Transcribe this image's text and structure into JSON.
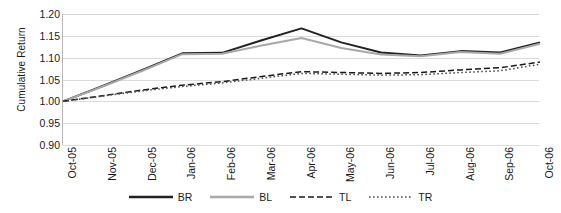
{
  "chart_data": {
    "type": "line",
    "title": "",
    "xlabel": "",
    "ylabel": "Cumulative Return",
    "ylim": [
      0.9,
      1.2
    ],
    "ytick_step": 0.05,
    "yticks": [
      "0.90",
      "0.95",
      "1.00",
      "1.05",
      "1.10",
      "1.15",
      "1.20"
    ],
    "grid": true,
    "legend_position": "bottom",
    "categories": [
      "Oct-05",
      "Nov-05",
      "Dec-05",
      "Jan-06",
      "Feb-06",
      "Mar-06",
      "Apr-06",
      "May-06",
      "Jun-06",
      "Jul-06",
      "Aug-06",
      "Sep-06",
      "Oct-06"
    ],
    "series": [
      {
        "name": "BR",
        "style": "solid",
        "color": "#222222",
        "values": [
          1.0,
          1.035,
          1.072,
          1.11,
          1.111,
          1.14,
          1.167,
          1.135,
          1.112,
          1.105,
          1.115,
          1.112,
          1.135
        ]
      },
      {
        "name": "BL",
        "style": "solid",
        "color": "#a8a8a8",
        "values": [
          1.0,
          1.034,
          1.07,
          1.108,
          1.109,
          1.128,
          1.145,
          1.122,
          1.107,
          1.103,
          1.113,
          1.109,
          1.132
        ]
      },
      {
        "name": "TL",
        "style": "dashed",
        "color": "#1a1a1a",
        "values": [
          1.0,
          1.013,
          1.026,
          1.037,
          1.045,
          1.057,
          1.068,
          1.066,
          1.064,
          1.066,
          1.072,
          1.077,
          1.09
        ]
      },
      {
        "name": "TR",
        "style": "dotted",
        "color": "#4d4d4d",
        "values": [
          1.0,
          1.012,
          1.024,
          1.034,
          1.042,
          1.053,
          1.064,
          1.062,
          1.06,
          1.061,
          1.066,
          1.07,
          1.085
        ]
      }
    ]
  },
  "legend": {
    "items": [
      {
        "label": "BR"
      },
      {
        "label": "BL"
      },
      {
        "label": "TL"
      },
      {
        "label": "TR"
      }
    ]
  }
}
